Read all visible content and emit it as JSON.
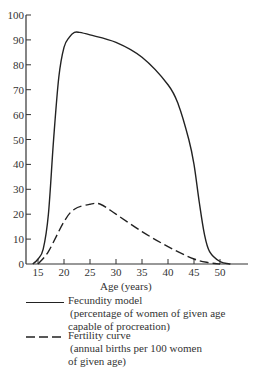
{
  "chart_data": {
    "type": "line",
    "title": "",
    "xlabel": "Age (years)",
    "ylabel": "",
    "xlim": [
      13,
      57
    ],
    "ylim": [
      0,
      100
    ],
    "x_ticks": [
      15,
      20,
      25,
      30,
      35,
      40,
      45,
      50
    ],
    "y_ticks": [
      0,
      10,
      20,
      30,
      40,
      50,
      60,
      70,
      80,
      90,
      100
    ],
    "grid": false,
    "legend_position": "below",
    "series": [
      {
        "name": "Fecundity model",
        "description": "(percentage of women of given age capable of procreation)",
        "style": "solid",
        "x": [
          14,
          15,
          16,
          17,
          18,
          19,
          20,
          21,
          22,
          23,
          25,
          30,
          35,
          40,
          42,
          44,
          45,
          46,
          47,
          48,
          50,
          52
        ],
        "values": [
          0,
          2,
          6,
          20,
          50,
          75,
          87,
          91,
          93,
          93,
          92,
          89,
          83,
          72,
          64,
          50,
          40,
          25,
          12,
          5,
          1,
          0
        ]
      },
      {
        "name": "Fertility curve",
        "description": "(annual births per 100 women of given age)",
        "style": "dashed",
        "x": [
          15,
          17,
          20,
          22,
          25,
          27,
          30,
          35,
          40,
          45,
          48,
          50
        ],
        "values": [
          0,
          5,
          17,
          22,
          24,
          24,
          20,
          13,
          7,
          2,
          0.5,
          0
        ]
      }
    ]
  },
  "axis": {
    "xlabel": "Age (years)",
    "y_tick_labels": [
      "0",
      "10",
      "20",
      "30",
      "40",
      "50",
      "60",
      "70",
      "80",
      "90",
      "100"
    ],
    "x_tick_labels": [
      "15",
      "20",
      "25",
      "30",
      "35",
      "40",
      "45",
      "50"
    ]
  },
  "legend": {
    "items": [
      {
        "title": "Fecundity model",
        "line1": "(percentage of women of given age",
        "line2": "capable of procreation)"
      },
      {
        "title": "Fertility curve",
        "line1": "(annual births per 100 women",
        "line2": "of given age)"
      }
    ]
  }
}
